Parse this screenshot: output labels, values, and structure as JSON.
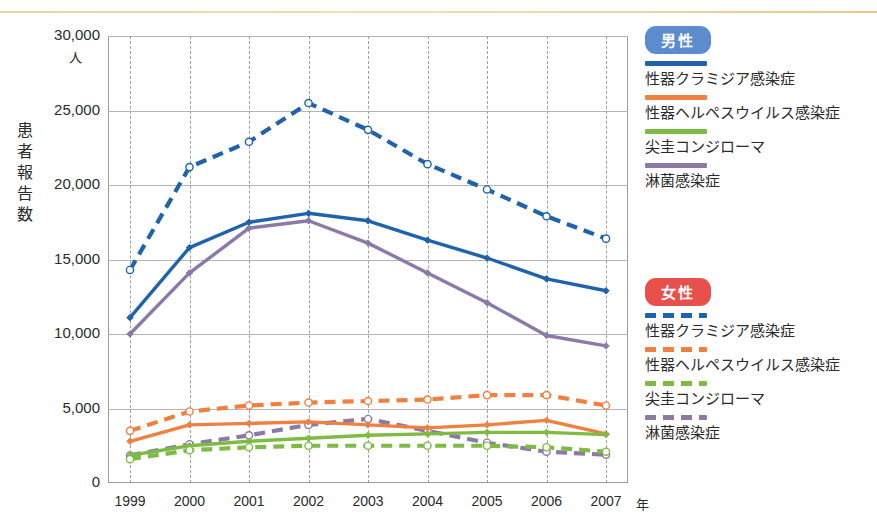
{
  "figure": {
    "y_axis_title": "患者報告数",
    "y_axis_unit": "人",
    "x_axis_unit": "年"
  },
  "legend": {
    "male": {
      "badge": "男性",
      "badge_color": "#5b8ccd",
      "items": [
        {
          "label": "性器クラミジア感染症",
          "color": "#1f63ad",
          "style": "solid"
        },
        {
          "label": "性器ヘルペスウイルス感染症",
          "color": "#ef8040",
          "style": "solid"
        },
        {
          "label": "尖圭コンジローマ",
          "color": "#7dbb42",
          "style": "solid"
        },
        {
          "label": "淋菌感染症",
          "color": "#8b7aa8",
          "style": "solid"
        }
      ]
    },
    "female": {
      "badge": "女性",
      "badge_color": "#e8504b",
      "items": [
        {
          "label": "性器クラミジア感染症",
          "color": "#1f63ad",
          "style": "dashed"
        },
        {
          "label": "性器ヘルペスウイルス感染症",
          "color": "#ef8040",
          "style": "dashed"
        },
        {
          "label": "尖圭コンジローマ",
          "color": "#7dbb42",
          "style": "dashed"
        },
        {
          "label": "淋菌感染症",
          "color": "#8b7aa8",
          "style": "dashed"
        }
      ]
    }
  },
  "chart_data": {
    "type": "line",
    "title": "",
    "xlabel": "年",
    "ylabel": "患者報告数",
    "yunit": "人",
    "x": [
      "1999",
      "2000",
      "2001",
      "2002",
      "2003",
      "2004",
      "2005",
      "2006",
      "2007"
    ],
    "tick_labels_y": [
      "0",
      "5,000",
      "10,000",
      "15,000",
      "20,000",
      "25,000",
      "30,000"
    ],
    "ylim": [
      0,
      30000
    ],
    "ytick_step": 5000,
    "grid": "both",
    "legend_position": "right",
    "series": [
      {
        "name": "性器クラミジア感染症（男性）",
        "group": "男性",
        "color": "#1f63ad",
        "style": "solid",
        "marker": "filled-diamond",
        "values": [
          11100,
          15800,
          17500,
          18100,
          17600,
          16300,
          15100,
          13700,
          12900
        ]
      },
      {
        "name": "性器ヘルペスウイルス感染症（男性）",
        "group": "男性",
        "color": "#ef8040",
        "style": "solid",
        "marker": "filled-diamond",
        "values": [
          2800,
          3900,
          4000,
          4100,
          3900,
          3700,
          3900,
          4200,
          3300
        ]
      },
      {
        "name": "尖圭コンジローマ（男性）",
        "group": "男性",
        "color": "#7dbb42",
        "style": "solid",
        "marker": "filled-diamond",
        "values": [
          1850,
          2500,
          2800,
          3000,
          3200,
          3300,
          3400,
          3400,
          3250
        ]
      },
      {
        "name": "淋菌感染症（男性）",
        "group": "男性",
        "color": "#8b7aa8",
        "style": "solid",
        "marker": "filled-diamond",
        "values": [
          10000,
          14100,
          17100,
          17600,
          16100,
          14100,
          12100,
          9900,
          9200
        ]
      },
      {
        "name": "性器クラミジア感染症（女性）",
        "group": "女性",
        "color": "#1f63ad",
        "style": "dashed",
        "marker": "open-circle",
        "values": [
          14300,
          21200,
          22900,
          25500,
          23700,
          21400,
          19700,
          17900,
          16400
        ]
      },
      {
        "name": "性器ヘルペスウイルス感染症（女性）",
        "group": "女性",
        "color": "#ef8040",
        "style": "dashed",
        "marker": "open-circle",
        "values": [
          3500,
          4800,
          5200,
          5400,
          5500,
          5600,
          5900,
          5900,
          5200
        ]
      },
      {
        "name": "尖圭コンジローマ（女性）",
        "group": "女性",
        "color": "#7dbb42",
        "style": "dashed",
        "marker": "open-circle",
        "values": [
          1600,
          2200,
          2400,
          2500,
          2500,
          2500,
          2500,
          2400,
          2100
        ]
      },
      {
        "name": "淋菌感染症（女性）",
        "group": "女性",
        "color": "#8b7aa8",
        "style": "dashed",
        "marker": "open-circle",
        "values": [
          1850,
          2600,
          3200,
          3900,
          4300,
          3500,
          2700,
          2100,
          1900
        ]
      }
    ]
  }
}
